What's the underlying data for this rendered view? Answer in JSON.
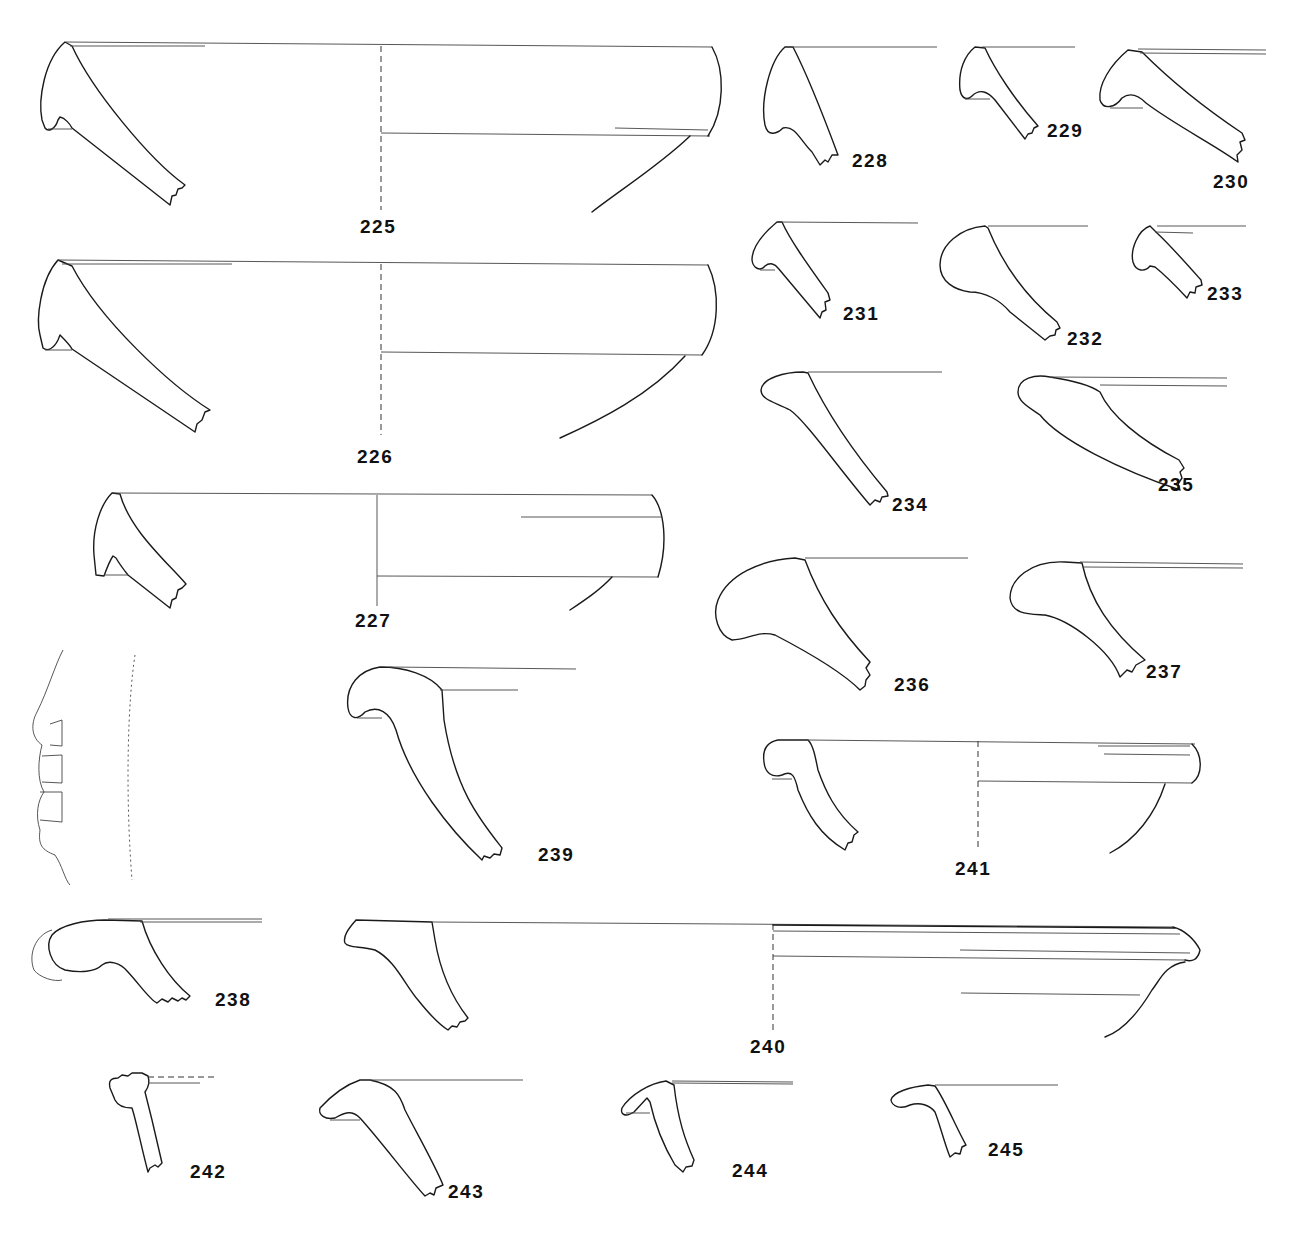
{
  "plate": {
    "type": "pottery rim profile drawings",
    "background": "#ffffff",
    "line_color": "#1a1a1a"
  },
  "labels": {
    "n225": "225",
    "n226": "226",
    "n227": "227",
    "n228": "228",
    "n229": "229",
    "n230": "230",
    "n231": "231",
    "n232": "232",
    "n233": "233",
    "n234": "234",
    "n235": "235",
    "n236": "236",
    "n237": "237",
    "n238": "238",
    "n239": "239",
    "n240": "240",
    "n241": "241",
    "n242": "242",
    "n243": "243",
    "n244": "244",
    "n245": "245"
  }
}
